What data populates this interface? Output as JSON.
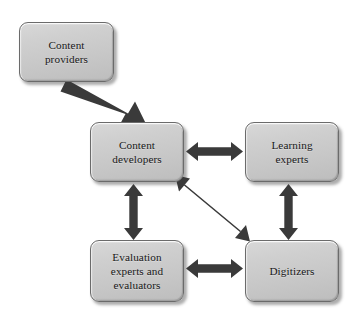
{
  "diagram": {
    "type": "flow-diagram",
    "canvas": {
      "width": 356,
      "height": 312,
      "background": "#ffffff"
    },
    "style": {
      "node_fill": "#cfcfcf",
      "node_border": "#6b6b6b",
      "node_text": "#171717",
      "arrow_color": "#3a3a3a",
      "shadow_color": "#3c3c3c"
    },
    "nodes": [
      {
        "id": "content-providers",
        "label": "Content\nproviders",
        "x": 19,
        "y": 22,
        "width": 95,
        "height": 60
      },
      {
        "id": "content-developers",
        "label": "Content\ndevelopers",
        "x": 90,
        "y": 122,
        "width": 94,
        "height": 60
      },
      {
        "id": "learning-experts",
        "label": "Learning\nexperts",
        "x": 245,
        "y": 122,
        "width": 94,
        "height": 60
      },
      {
        "id": "evaluation-experts",
        "label": "Evaluation\nexperts and\nevaluators",
        "x": 90,
        "y": 240,
        "width": 94,
        "height": 62
      },
      {
        "id": "digitizers",
        "label": "Digitizers",
        "x": 245,
        "y": 240,
        "width": 94,
        "height": 62
      }
    ],
    "edges": [
      {
        "id": "providers-to-developers",
        "from": "content-providers",
        "to": "content-developers",
        "direction": "single",
        "orientation": "diagonal"
      },
      {
        "id": "developers-learning",
        "from": "content-developers",
        "to": "learning-experts",
        "direction": "double",
        "orientation": "horizontal"
      },
      {
        "id": "developers-evaluation",
        "from": "content-developers",
        "to": "evaluation-experts",
        "direction": "double",
        "orientation": "vertical"
      },
      {
        "id": "learning-digitizers",
        "from": "learning-experts",
        "to": "digitizers",
        "direction": "double",
        "orientation": "vertical"
      },
      {
        "id": "evaluation-digitizers",
        "from": "evaluation-experts",
        "to": "digitizers",
        "direction": "double",
        "orientation": "horizontal"
      },
      {
        "id": "developers-digitizers",
        "from": "content-developers",
        "to": "digitizers",
        "direction": "double",
        "orientation": "diagonal"
      }
    ]
  }
}
